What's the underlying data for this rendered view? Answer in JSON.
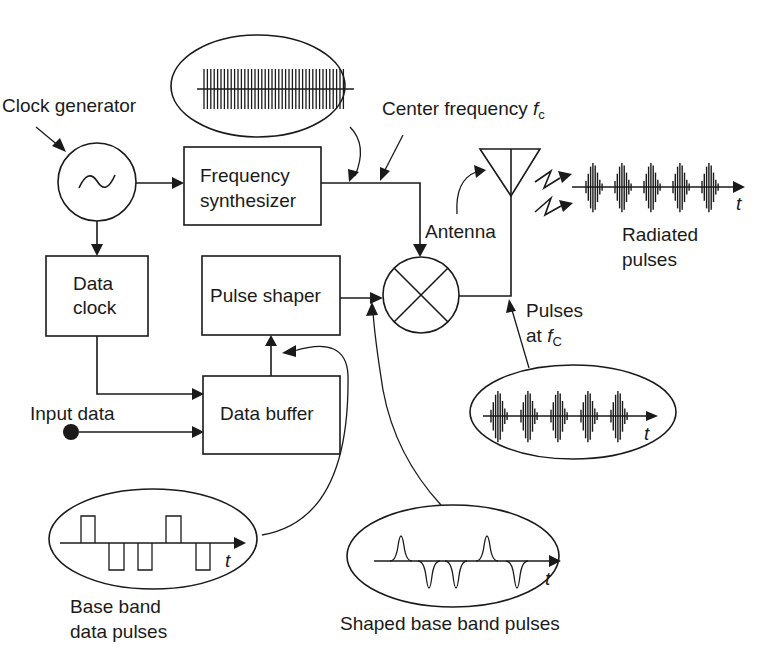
{
  "diagram": {
    "type": "block-diagram",
    "blocks": {
      "clock_generator": {
        "label": "Clock generator",
        "symbol": "sine-oscillator"
      },
      "frequency_synthesizer": {
        "line1": "Frequency",
        "line2": "synthesizer"
      },
      "data_clock": {
        "line1": "Data",
        "line2": "clock"
      },
      "pulse_shaper": {
        "label": "Pulse shaper"
      },
      "data_buffer": {
        "label": "Data buffer"
      },
      "mixer": {
        "symbol": "multiplier-circle"
      },
      "antenna": {
        "label": "Antenna"
      }
    },
    "labels": {
      "center_frequency": "Center frequency ",
      "fc_symbol": "f",
      "fc_subscript": "c",
      "input_data": "Input data",
      "radiated_line1": "Radiated",
      "radiated_line2": "pulses",
      "pulses_at_line1": "Pulses",
      "pulses_at_line2": "at ",
      "pulses_fc_symbol": "f",
      "pulses_fc_subscript": "C",
      "baseband_line1": "Base band",
      "baseband_line2": "data pulses",
      "shaped_label": "Shaped base band pulses",
      "time_axis": "t"
    },
    "insets": {
      "carrier": "continuous high-frequency carrier",
      "modulated_pulses": 5,
      "radiated_pulses": 5,
      "baseband_pulses": [
        "+",
        "-",
        "-",
        "+",
        "-"
      ],
      "shaped_pulses": [
        "+",
        "-",
        "-",
        "+",
        "-"
      ]
    },
    "connections": [
      [
        "clock_generator",
        "frequency_synthesizer"
      ],
      [
        "clock_generator",
        "data_clock"
      ],
      [
        "frequency_synthesizer",
        "mixer"
      ],
      [
        "data_clock",
        "data_buffer"
      ],
      [
        "input_data",
        "data_buffer"
      ],
      [
        "data_buffer",
        "pulse_shaper"
      ],
      [
        "pulse_shaper",
        "mixer"
      ],
      [
        "mixer",
        "antenna"
      ]
    ]
  }
}
